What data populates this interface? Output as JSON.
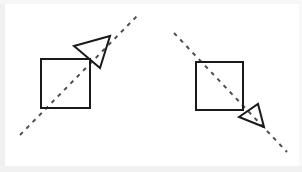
{
  "figure": {
    "width": 302,
    "height": 172,
    "background_color": "#ffffff",
    "frame_color": "#f0f0f1",
    "stroke_color": "#1a1a1a",
    "stroke_width": 2,
    "dash_color": "#4d4d55",
    "dash_width": 2,
    "dash_pattern": "4 5"
  },
  "panels": [
    {
      "id": "left-panel",
      "label": "Left figure",
      "line": {
        "name": "dashed-axis-line",
        "direction": "ascending",
        "x1": 20,
        "y1": 135,
        "x2": 137,
        "y2": 16
      },
      "square": {
        "name": "square-shape",
        "x": 41,
        "y": 59,
        "width": 49,
        "height": 49
      },
      "triangle": {
        "name": "triangle-shape",
        "points": "74,46 110,36 100,68"
      }
    },
    {
      "id": "right-panel",
      "label": "Right figure",
      "line": {
        "name": "dashed-axis-line",
        "direction": "descending",
        "x1": 174,
        "y1": 33,
        "x2": 287,
        "y2": 152
      },
      "square": {
        "name": "square-shape",
        "x": 196,
        "y": 62,
        "width": 47,
        "height": 48
      },
      "triangle": {
        "name": "triangle-shape",
        "points": "239,117 258,104 264,127"
      }
    }
  ]
}
